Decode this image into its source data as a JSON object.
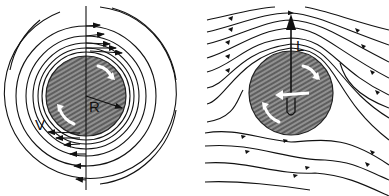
{
  "figure": {
    "panels": [
      {
        "id": "circulation",
        "description": "Free vortex circulation around a rotating cylinder",
        "labels": {
          "radius": "R",
          "velocity": "V"
        }
      },
      {
        "id": "magnus",
        "description": "Uniform flow plus circulation around a rotating cylinder producing lift",
        "labels": {
          "lift": "L",
          "freestream": "U"
        }
      }
    ],
    "colors": {
      "line": "#111111",
      "cylinder_fill": "#6a6a6a",
      "hatch": "#dddddd",
      "arrow_white": "#ffffff",
      "background": "#ffffff"
    }
  }
}
